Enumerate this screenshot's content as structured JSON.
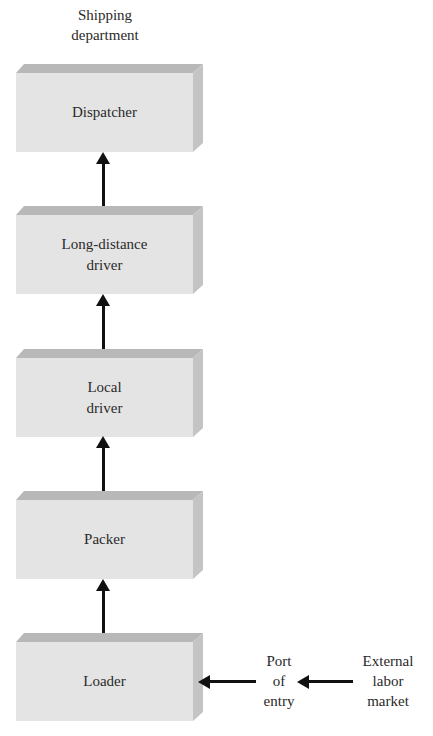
{
  "diagram": {
    "title": "Shipping department",
    "title_lines": [
      "Shipping",
      "department"
    ],
    "nodes": [
      {
        "id": "dispatcher",
        "lines": [
          "Dispatcher"
        ]
      },
      {
        "id": "long-distance-driver",
        "lines": [
          "Long-distance",
          "driver"
        ]
      },
      {
        "id": "local-driver",
        "lines": [
          "Local",
          "driver"
        ]
      },
      {
        "id": "packer",
        "lines": [
          "Packer"
        ]
      },
      {
        "id": "loader",
        "lines": [
          "Loader"
        ]
      }
    ],
    "external_nodes": [
      {
        "id": "port-of-entry",
        "lines": [
          "Port",
          "of",
          "entry"
        ]
      },
      {
        "id": "external-labor-market",
        "lines": [
          "External",
          "labor",
          "market"
        ]
      }
    ],
    "edges": [
      {
        "from": "external-labor-market",
        "to": "port-of-entry"
      },
      {
        "from": "port-of-entry",
        "to": "loader"
      },
      {
        "from": "loader",
        "to": "packer"
      },
      {
        "from": "packer",
        "to": "local-driver"
      },
      {
        "from": "local-driver",
        "to": "long-distance-driver"
      },
      {
        "from": "long-distance-driver",
        "to": "dispatcher"
      }
    ],
    "colors": {
      "box_front": "#e4e4e4",
      "box_top": "#b8b8b8",
      "box_side": "#c4c4c4",
      "arrow": "#111111"
    }
  }
}
